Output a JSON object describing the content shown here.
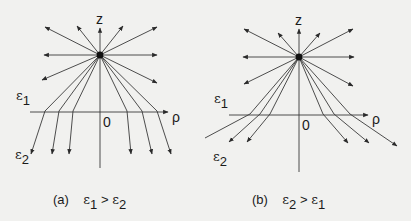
{
  "figure": {
    "panels": [
      {
        "id": "a",
        "axis_labels": {
          "z": "z",
          "rho": "ρ",
          "origin": "0"
        },
        "media_labels": {
          "upper_symbol": "ε",
          "upper_index": "1",
          "lower_symbol": "ε",
          "lower_index": "2"
        },
        "caption": {
          "tag": "(a)",
          "lhs_symbol": "ε",
          "lhs_index": "1",
          "relation": ">",
          "rhs_symbol": "ε",
          "rhs_index": "2"
        },
        "description": "Point charge above planar interface; field lines refract toward normal in lower medium"
      },
      {
        "id": "b",
        "axis_labels": {
          "z": "z",
          "rho": "ρ",
          "origin": "0"
        },
        "media_labels": {
          "upper_symbol": "ε",
          "upper_index": "1",
          "lower_symbol": "ε",
          "lower_index": "2"
        },
        "caption": {
          "tag": "(b)",
          "lhs_symbol": "ε",
          "lhs_index": "2",
          "relation": ">",
          "rhs_symbol": "ε",
          "rhs_index": "1"
        },
        "description": "Point charge above planar interface; field lines refract away from normal in lower medium"
      }
    ],
    "colors": {
      "line": "#3a3a3a",
      "charge": "#111111",
      "background": "#f1f1ef"
    }
  }
}
